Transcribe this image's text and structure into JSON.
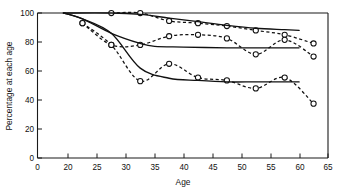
{
  "chart_data": {
    "type": "line",
    "title": "",
    "xlabel": "Age",
    "ylabel": "Percentage at each age",
    "xlim": [
      0,
      65
    ],
    "ylim": [
      0,
      100
    ],
    "grid": false,
    "legend": null,
    "xticks": [
      0,
      20,
      25,
      30,
      35,
      40,
      45,
      50,
      55,
      60,
      65
    ],
    "yticks": [
      0,
      20,
      40,
      60,
      80,
      100
    ],
    "xtick_labels": [
      "0",
      "20",
      "25",
      "30",
      "35",
      "40",
      "45",
      "50",
      "55",
      "60",
      "65"
    ],
    "ytick_labels": [
      "0",
      "20",
      "40",
      "60",
      "80",
      "100"
    ],
    "axis_break_note": "x axis compressed between 0 and 20",
    "series": [
      {
        "name": "Top group - observed",
        "style": "dashed-with-circles",
        "x": [
          27.5,
          32.5,
          37.5,
          42.5,
          47.5,
          52.5,
          57.5,
          62.5
        ],
        "values": [
          100,
          100,
          94.5,
          93,
          91,
          88,
          85,
          79
        ]
      },
      {
        "name": "Top group - fitted",
        "style": "solid",
        "x": [
          17,
          27.5,
          32.5,
          37.5,
          42.5,
          47.5,
          52.5,
          57.5,
          60
        ],
        "values": [
          100,
          100,
          99,
          96.5,
          94,
          91.5,
          89.5,
          88.5,
          88
        ]
      },
      {
        "name": "Middle group - observed",
        "style": "dashed-with-circles",
        "x": [
          22.5,
          27.5,
          32.5,
          37.5,
          42.5,
          47.5,
          52.5,
          57.5,
          62.5
        ],
        "values": [
          93,
          78,
          78,
          84,
          85,
          82.5,
          71.5,
          81.5,
          70
        ]
      },
      {
        "name": "Middle group - fitted",
        "style": "solid",
        "x": [
          17,
          22.5,
          27.5,
          32.5,
          35,
          40,
          47.5,
          52.5,
          57.5,
          60
        ],
        "values": [
          100,
          96,
          86,
          79,
          77,
          76.5,
          76,
          76,
          76,
          76
        ]
      },
      {
        "name": "Lower group - observed",
        "style": "dashed-with-circles",
        "x": [
          22.5,
          27.5,
          32.5,
          37.5,
          42.5,
          47.5,
          52.5,
          57.5,
          62.5
        ],
        "values": [
          93,
          78,
          53,
          65,
          55.5,
          53.5,
          48,
          55.5,
          37.5
        ]
      },
      {
        "name": "Lower group - fitted",
        "style": "solid",
        "x": [
          17,
          22.5,
          27.5,
          32.5,
          37.5,
          42.5,
          47.5,
          52.5,
          57.5,
          60
        ],
        "values": [
          100,
          96,
          86,
          62,
          55,
          53.5,
          52.5,
          52.5,
          52.5,
          52.5
        ]
      }
    ]
  },
  "axes": {
    "x_title": "Age",
    "y_title": "Percentage at each age"
  }
}
